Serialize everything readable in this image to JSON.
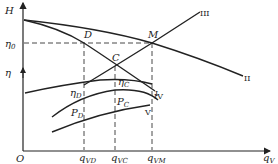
{
  "diagram": {
    "type": "pump-fan performance curves",
    "axes": {
      "y_top_label": "H",
      "y_mid_label": "η",
      "origin_label": "O",
      "x_label": "q",
      "x_label_sub": "V"
    },
    "levels": {
      "eta0": {
        "label": "η",
        "sub": "0"
      }
    },
    "points": {
      "D": "D",
      "C": "C",
      "M": "M"
    },
    "curve_labels": {
      "I": "I",
      "II": "II",
      "III": "III",
      "IV": "IV",
      "V": "V",
      "eta_D": {
        "label": "η",
        "sub": "D"
      },
      "eta_C": {
        "label": "η",
        "sub": "C"
      },
      "P_D": {
        "label": "P",
        "sub": "D"
      },
      "P_C": {
        "label": "P",
        "sub": "C"
      }
    },
    "x_ticks": [
      {
        "label": "q",
        "sub": "VD"
      },
      {
        "label": "q",
        "sub": "VC"
      },
      {
        "label": "q",
        "sub": "VM"
      }
    ]
  }
}
